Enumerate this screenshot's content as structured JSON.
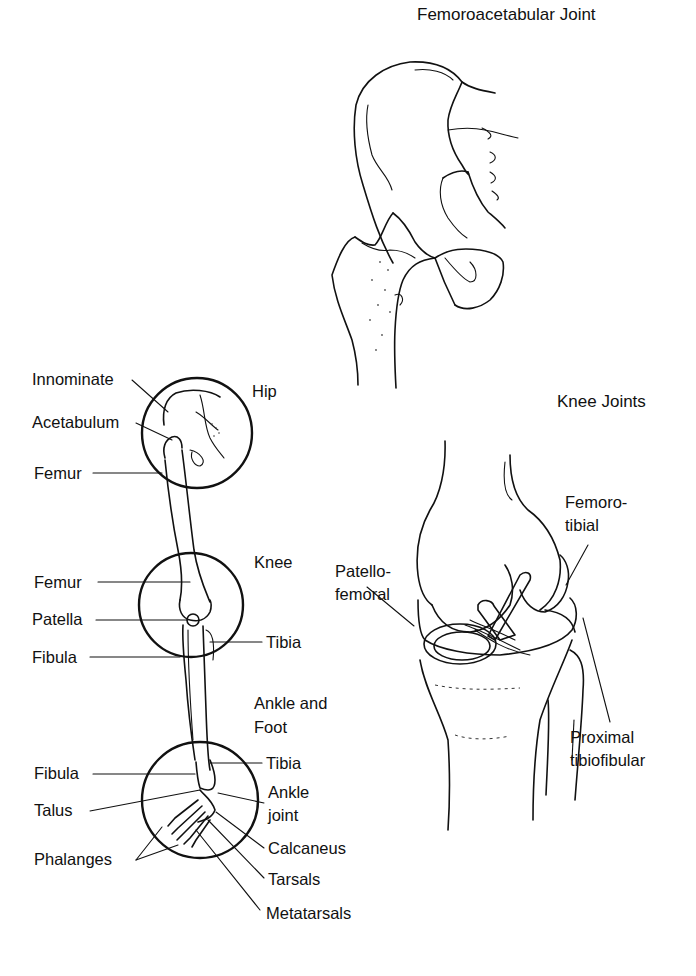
{
  "titles": {
    "hip_joint": "Femoroacetabular Joint",
    "knee_joints": "Knee Joints"
  },
  "leg_diagram": {
    "regions": {
      "hip": "Hip",
      "knee": "Knee",
      "ankle_foot_line1": "Ankle and",
      "ankle_foot_line2": "Foot"
    },
    "labels": {
      "innominate": "Innominate",
      "acetabulum": "Acetabulum",
      "femur_hip": "Femur",
      "femur_knee": "Femur",
      "patella": "Patella",
      "fibula_knee": "Fibula",
      "tibia_knee": "Tibia",
      "tibia_ankle": "Tibia",
      "fibula_ankle": "Fibula",
      "talus": "Talus",
      "ankle_joint_line1": "Ankle",
      "ankle_joint_line2": "joint",
      "phalanges": "Phalanges",
      "calcaneus": "Calcaneus",
      "tarsals": "Tarsals",
      "metatarsals": "Metatarsals"
    }
  },
  "knee_diagram": {
    "labels": {
      "femorotibial_line1": "Femoro-",
      "femorotibial_line2": "tibial",
      "patellofemoral_line1": "Patello-",
      "patellofemoral_line2": "femoral",
      "proximal_tibiofibular_line1": "Proximal",
      "proximal_tibiofibular_line2": "tibiofibular"
    }
  }
}
